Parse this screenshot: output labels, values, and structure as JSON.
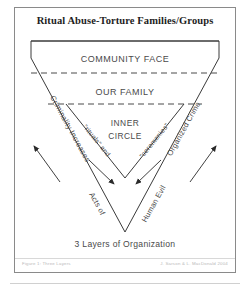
{
  "figure": {
    "title": "Ritual Abuse-Torture Families/Groups",
    "caption": "3 Layers of Organization"
  },
  "layers": [
    {
      "id": "community-face",
      "label": "COMMUNITY FACE"
    },
    {
      "id": "our-family",
      "label": "OUR FAMILY"
    },
    {
      "id": "inner-circle",
      "label_line1": "INNER",
      "label_line2": "CIRCLE"
    }
  ],
  "inner_triangle_labels": {
    "left": "\"rituals\" and",
    "right": "\"ceremonies\""
  },
  "axis_labels": {
    "left_outer": "Criminality Increases",
    "right_outer": "Organized Crime",
    "left_inner": "Acts of",
    "right_inner": "Human Evil"
  },
  "footer": {
    "left": "Figure 1: Three Layers",
    "right": "J. Sarson & L. MacDonald 2004"
  },
  "colors": {
    "frame": "#8a8a8a",
    "stroke": "#3a3a3a",
    "dashed": "#4a4a4a",
    "text": "#4a4a4a",
    "title": "#1d1d1d",
    "footer_text": "#b9b9b9",
    "background": "#ffffff"
  }
}
